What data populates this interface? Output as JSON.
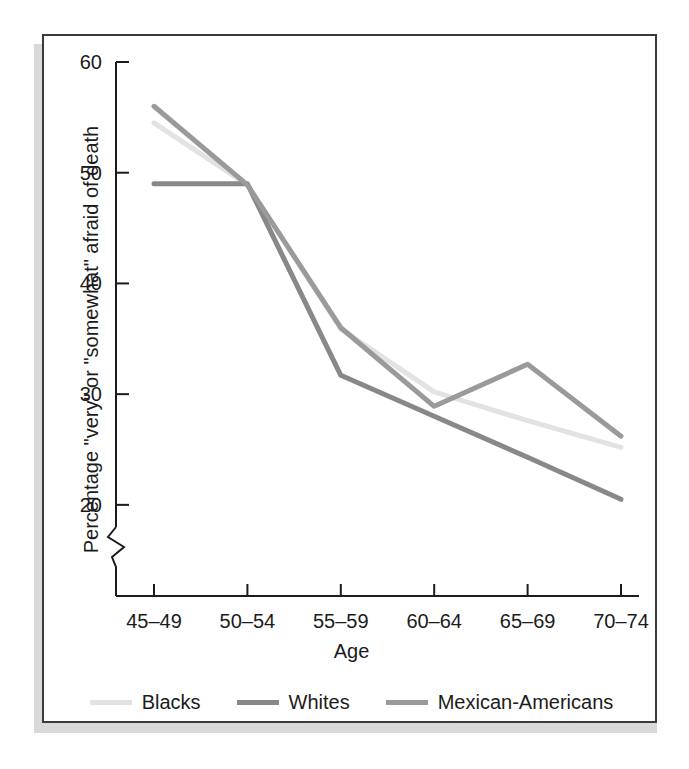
{
  "chart_data": {
    "type": "line",
    "title": "",
    "xlabel": "Age",
    "ylabel": "Percentage \"very\" or \"somewhat\" afraid of death",
    "categories": [
      "45–49",
      "50–54",
      "55–59",
      "60–64",
      "65–69",
      "70–74"
    ],
    "ylim": [
      18,
      60
    ],
    "yticks": [
      20,
      30,
      40,
      50,
      60
    ],
    "ytick_labels": [
      "20",
      "30",
      "40",
      "50",
      "60"
    ],
    "axis_break": true,
    "grid": false,
    "legend_position": "bottom",
    "series": [
      {
        "name": "Blacks",
        "color": "#e2e2e2",
        "values": [
          54.5,
          48.9,
          35.9,
          30.2,
          27.6,
          25.2
        ]
      },
      {
        "name": "Whites",
        "color": "#888888",
        "values": [
          49.0,
          49.0,
          31.7,
          28.0,
          24.3,
          20.5
        ]
      },
      {
        "name": "Mexican-Americans",
        "color": "#9a9a9a",
        "values": [
          56.0,
          48.9,
          36.0,
          28.9,
          32.7,
          26.2
        ]
      }
    ]
  },
  "axes": {
    "y_title": "Percentage \"very\" or \"somewhat\" afraid of death",
    "x_title": "Age"
  },
  "colors": {
    "frame_border": "#3a3a3a",
    "axis_line": "#1b1b1b",
    "background": "#ffffff",
    "shadow": "#d9d9d9"
  }
}
